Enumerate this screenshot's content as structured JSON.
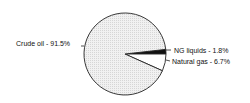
{
  "chart_data": {
    "type": "pie",
    "title": "",
    "slices": [
      {
        "label": "Crude oil",
        "value": 91.5,
        "display": "Crude oil - 91.5%",
        "fill": "#ececec"
      },
      {
        "label": "NG liquids",
        "value": 1.8,
        "display": "NG liquids - 1.8%",
        "fill": "#111111"
      },
      {
        "label": "Natural gas",
        "value": 6.7,
        "display": "Natural gas - 6.7%",
        "fill": "#ffffff"
      }
    ],
    "legend": "none (inline labels)",
    "units": "%"
  },
  "labels": {
    "crude_oil": "Crude oil - 91.5%",
    "ng_liquids": "NG liquids - 1.8%",
    "natural_gas": "Natural gas - 6.7%"
  }
}
